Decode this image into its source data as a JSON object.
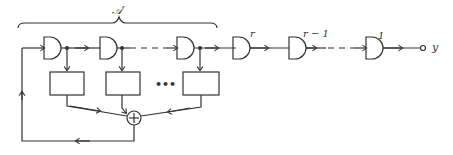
{
  "diagram": {
    "bracket_label": "𝒜′",
    "delay_labels": [
      "r",
      "r − 1",
      "1"
    ],
    "output_label": "y",
    "ellipsis": "•••",
    "summer_symbol": "+",
    "colors": {
      "stroke": "#333333",
      "background": "#ffffff"
    }
  }
}
